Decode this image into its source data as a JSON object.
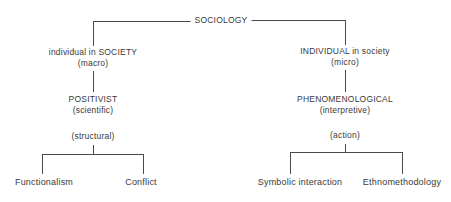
{
  "diagram": {
    "root": {
      "label": "SOCIOLOGY"
    },
    "left": {
      "level1": {
        "line1": "individual in SOCIETY",
        "line2": "(macro)"
      },
      "level2": {
        "line1": "POSITIVIST",
        "line2": "(scientific)"
      },
      "level3": {
        "line1": "(structural)"
      },
      "children": [
        "Functionalism",
        "Conflict"
      ]
    },
    "right": {
      "level1": {
        "line1": "INDIVIDUAL in society",
        "line2": "(micro)"
      },
      "level2": {
        "line1": "PHENOMENOLOGICAL",
        "line2": "(interpretive)"
      },
      "level3": {
        "line1": "(action)"
      },
      "children": [
        "Symbolic interaction",
        "Ethnomethodology"
      ]
    },
    "line_color": "#4a4a4a",
    "text_color": "#3a3a3a"
  }
}
